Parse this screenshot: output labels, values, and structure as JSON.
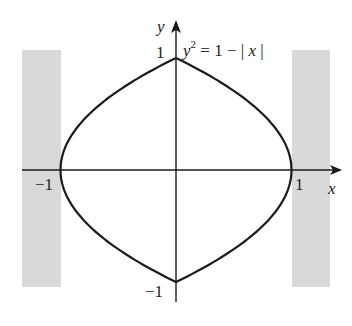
{
  "chart_data": {
    "type": "line",
    "title": "",
    "equation": "y^2 = 1 - |x|",
    "xlabel": "x",
    "ylabel": "y",
    "x_ticks": [
      {
        "value": -1,
        "label": "−1"
      },
      {
        "value": 1,
        "label": "1"
      }
    ],
    "y_ticks": [
      {
        "value": 1,
        "label": "1"
      },
      {
        "value": -1,
        "label": "−1"
      }
    ],
    "xlim": [
      -1.35,
      1.35
    ],
    "ylim": [
      -1.3,
      1.3
    ],
    "curve": {
      "description": "Closed curve |x| = 1 - y^2",
      "points": [
        [
          0,
          1
        ],
        [
          0.19,
          0.9
        ],
        [
          0.36,
          0.8
        ],
        [
          0.51,
          0.7
        ],
        [
          0.64,
          0.6
        ],
        [
          0.75,
          0.5
        ],
        [
          0.84,
          0.4
        ],
        [
          0.91,
          0.3
        ],
        [
          0.96,
          0.2
        ],
        [
          0.99,
          0.1
        ],
        [
          1,
          0
        ],
        [
          0.99,
          -0.1
        ],
        [
          0.96,
          -0.2
        ],
        [
          0.91,
          -0.3
        ],
        [
          0.84,
          -0.4
        ],
        [
          0.75,
          -0.5
        ],
        [
          0.64,
          -0.6
        ],
        [
          0.51,
          -0.7
        ],
        [
          0.36,
          -0.8
        ],
        [
          0.19,
          -0.9
        ],
        [
          0,
          -1
        ]
      ]
    },
    "shaded_regions": [
      {
        "x_from": -1.35,
        "x_to": -1,
        "y_from": -1.05,
        "y_to": 1.07,
        "color": "#d9d9d9"
      },
      {
        "x_from": 1,
        "x_to": 1.34,
        "y_from": -1.05,
        "y_to": 1.07,
        "color": "#d9d9d9"
      }
    ],
    "grid": false
  },
  "labels": {
    "x_axis": "x",
    "y_axis": "y",
    "tick_x_neg": "−1",
    "tick_x_pos": "1",
    "tick_y_pos": "1",
    "tick_y_neg": "−1",
    "eq_y": "y",
    "eq_exp": "2",
    "eq_rest": " = 1 − ",
    "eq_bar1": "|",
    "eq_x": " x ",
    "eq_bar2": "|"
  },
  "colors": {
    "curve": "#1a1a1a",
    "axis": "#1a1a1a",
    "shade": "#d9d9d9"
  }
}
